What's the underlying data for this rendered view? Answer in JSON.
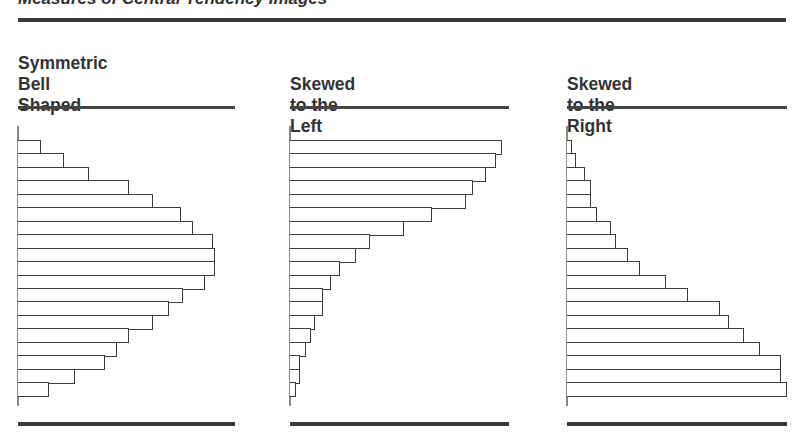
{
  "header": {
    "title": "Measures of Central Tendency Images"
  },
  "panels": [
    {
      "title": "Symmetric\nBell Shaped",
      "shape": "symmetric"
    },
    {
      "title": "Skewed to the Left",
      "shape": "left-skewed"
    },
    {
      "title": "Skewed to the Right",
      "shape": "right-skewed"
    }
  ],
  "colors": {
    "ink": "#3c3c3c",
    "axis": "#888888",
    "background": "#ffffff"
  },
  "chart_data": [
    {
      "type": "bar",
      "orientation": "horizontal",
      "title": "Symmetric Bell Shaped",
      "xlabel": "",
      "ylabel": "",
      "grid": false,
      "legend": false,
      "categories": [
        "1",
        "2",
        "3",
        "4",
        "5",
        "6",
        "7",
        "8",
        "9",
        "10",
        "11",
        "12",
        "13",
        "14",
        "15",
        "16",
        "17",
        "18",
        "19"
      ],
      "values": [
        23,
        46,
        71,
        111,
        135,
        163,
        175,
        195,
        197,
        197,
        187,
        165,
        151,
        135,
        111,
        99,
        87,
        57,
        31
      ]
    },
    {
      "type": "bar",
      "orientation": "horizontal",
      "title": "Skewed to the Left",
      "xlabel": "",
      "ylabel": "",
      "grid": false,
      "legend": false,
      "categories": [
        "1",
        "2",
        "3",
        "4",
        "5",
        "6",
        "7",
        "8",
        "9",
        "10",
        "11",
        "12",
        "13",
        "14",
        "15",
        "16",
        "17",
        "18",
        "19"
      ],
      "values": [
        212,
        206,
        196,
        183,
        176,
        142,
        114,
        80,
        66,
        50,
        41,
        33,
        33,
        25,
        21,
        16,
        10,
        10,
        6
      ]
    },
    {
      "type": "bar",
      "orientation": "horizontal",
      "title": "Skewed to the Right",
      "xlabel": "",
      "ylabel": "",
      "grid": false,
      "legend": false,
      "categories": [
        "1",
        "2",
        "3",
        "4",
        "5",
        "6",
        "7",
        "8",
        "9",
        "10",
        "11",
        "12",
        "13",
        "14",
        "15",
        "16",
        "17",
        "18",
        "19"
      ],
      "values": [
        5,
        9,
        18,
        24,
        24,
        30,
        44,
        49,
        61,
        73,
        99,
        121,
        153,
        162,
        177,
        193,
        214,
        214,
        220
      ]
    }
  ]
}
